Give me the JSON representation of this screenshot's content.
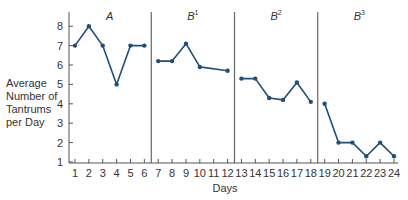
{
  "chart_data": {
    "type": "line",
    "title": "",
    "xlabel": "Days",
    "ylabel": "Average Number of Tantrums per Day",
    "ylabel_lines": [
      "Average",
      "Number of",
      "Tantrums",
      "per Day"
    ],
    "xlim": [
      1,
      24
    ],
    "ylim": [
      1,
      8
    ],
    "x_ticks": [
      1,
      2,
      3,
      4,
      5,
      6,
      7,
      8,
      9,
      10,
      11,
      12,
      13,
      14,
      15,
      16,
      17,
      18,
      19,
      20,
      21,
      22,
      23,
      24
    ],
    "y_ticks": [
      1,
      2,
      3,
      4,
      5,
      6,
      7,
      8
    ],
    "grid": false,
    "legend": null,
    "line_color": "#1f4e79",
    "phase_separator_color": "#666666",
    "phases": [
      {
        "label": "A",
        "sup": "",
        "start_day": 1,
        "end_day": 6,
        "points": [
          [
            1,
            7
          ],
          [
            2,
            8
          ],
          [
            3,
            7
          ],
          [
            4,
            5
          ],
          [
            5,
            7
          ],
          [
            6,
            7
          ]
        ]
      },
      {
        "label": "B",
        "sup": "1",
        "start_day": 7,
        "end_day": 12,
        "points": [
          [
            7,
            6.2
          ],
          [
            8,
            6.2
          ],
          [
            9,
            7.1
          ],
          [
            10,
            5.9
          ],
          [
            12,
            5.7
          ]
        ]
      },
      {
        "label": "B",
        "sup": "2",
        "start_day": 13,
        "end_day": 18,
        "points": [
          [
            13,
            5.3
          ],
          [
            14,
            5.3
          ],
          [
            15,
            4.3
          ],
          [
            16,
            4.2
          ],
          [
            17,
            5.1
          ],
          [
            18,
            4.1
          ]
        ]
      },
      {
        "label": "B",
        "sup": "3",
        "start_day": 19,
        "end_day": 24,
        "points": [
          [
            19,
            4.0
          ],
          [
            20,
            2.0
          ],
          [
            21,
            2.0
          ],
          [
            22,
            1.3
          ],
          [
            23,
            2.0
          ],
          [
            24,
            1.3
          ]
        ]
      }
    ],
    "phase_boundaries": [
      6.5,
      12.5,
      18.5
    ]
  }
}
